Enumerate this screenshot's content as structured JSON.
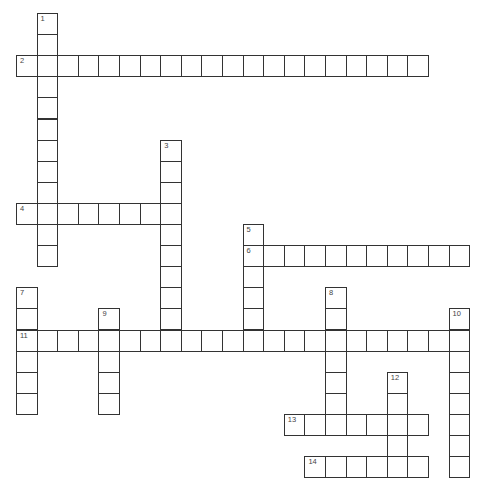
{
  "puzzle": {
    "type": "crossword",
    "grid": {
      "origin_x": 16,
      "origin_y": 13,
      "cell_w": 20.6,
      "cell_h": 21.1,
      "cols": 22,
      "rows": 23
    },
    "colors": {
      "border": "#333333",
      "cell_fill": "#ffffff",
      "number": "#444444",
      "background": "#ffffff"
    },
    "entries": [
      {
        "number": "1",
        "direction": "down",
        "col": 1,
        "row": 0,
        "length": 12
      },
      {
        "number": "2",
        "direction": "across",
        "col": 0,
        "row": 2,
        "length": 20
      },
      {
        "number": "3",
        "direction": "down",
        "col": 7,
        "row": 6,
        "length": 10
      },
      {
        "number": "4",
        "direction": "across",
        "col": 0,
        "row": 9,
        "length": 8
      },
      {
        "number": "5",
        "direction": "down",
        "col": 11,
        "row": 10,
        "length": 6
      },
      {
        "number": "6",
        "direction": "across",
        "col": 11,
        "row": 11,
        "length": 11
      },
      {
        "number": "7",
        "direction": "down",
        "col": 0,
        "row": 13,
        "length": 6
      },
      {
        "number": "8",
        "direction": "down",
        "col": 15,
        "row": 13,
        "length": 7
      },
      {
        "number": "9",
        "direction": "down",
        "col": 4,
        "row": 14,
        "length": 5
      },
      {
        "number": "10",
        "direction": "down",
        "col": 21,
        "row": 14,
        "length": 8
      },
      {
        "number": "11",
        "direction": "across",
        "col": 0,
        "row": 15,
        "length": 22
      },
      {
        "number": "12",
        "direction": "down",
        "col": 18,
        "row": 17,
        "length": 5
      },
      {
        "number": "13",
        "direction": "across",
        "col": 13,
        "row": 19,
        "length": 7
      },
      {
        "number": "14",
        "direction": "across",
        "col": 14,
        "row": 21,
        "length": 6
      }
    ]
  }
}
